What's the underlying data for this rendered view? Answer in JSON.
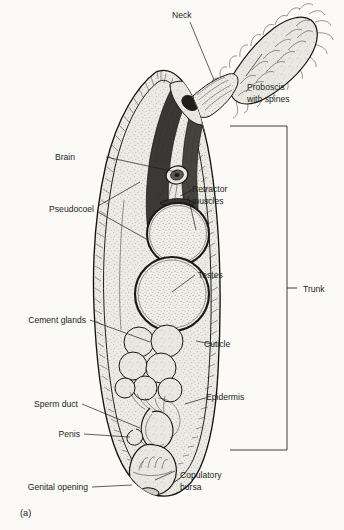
{
  "figure": {
    "caption": "(a)"
  },
  "palette": {
    "ink": "#141414",
    "text": "#1d1d1d",
    "page_background": "#fbfaf7",
    "body_fill": "#e8e6e0",
    "organ_fill": "#efedE8",
    "proboscis_fill": "#e3e1db"
  },
  "labels": {
    "neck": "Neck",
    "proboscis_line1": "Proboscis",
    "proboscis_line2": "with spines",
    "brain": "Brain",
    "retractor_line1": "Retractor",
    "retractor_line2": "muscles",
    "pseudocoel": "Pseudocoel",
    "testes": "Testes",
    "trunk": "Trunk",
    "cement_glands": "Cement glands",
    "cuticle": "Cuticle",
    "epidermis": "Epidermis",
    "sperm_duct": "Sperm duct",
    "penis": "Penis",
    "genital_opening": "Genital opening",
    "copulatory_line1": "Copulatory",
    "copulatory_line2": "bursa"
  }
}
